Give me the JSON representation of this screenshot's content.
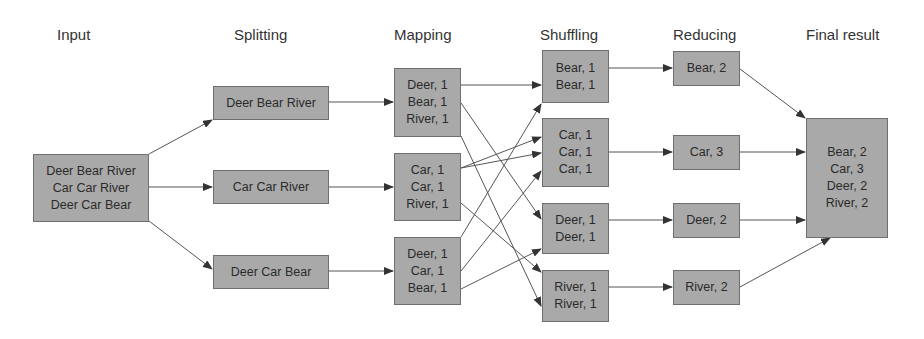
{
  "headers": {
    "input": "Input",
    "splitting": "Splitting",
    "mapping": "Mapping",
    "shuffling": "Shuffling",
    "reducing": "Reducing",
    "final": "Final result"
  },
  "input": {
    "lines": [
      "Deer Bear River",
      "Car Car River",
      "Deer Car Bear"
    ]
  },
  "splitting": [
    {
      "label": "Deer Bear River"
    },
    {
      "label": "Car Car River"
    },
    {
      "label": "Deer Car Bear"
    }
  ],
  "mapping": [
    {
      "lines": [
        "Deer, 1",
        "Bear, 1",
        "River, 1"
      ]
    },
    {
      "lines": [
        "Car, 1",
        "Car, 1",
        "River, 1"
      ]
    },
    {
      "lines": [
        "Deer, 1",
        "Car, 1",
        "Bear, 1"
      ]
    }
  ],
  "shuffling": [
    {
      "lines": [
        "Bear, 1",
        "Bear, 1"
      ]
    },
    {
      "lines": [
        "Car, 1",
        "Car, 1",
        "Car, 1"
      ]
    },
    {
      "lines": [
        "Deer, 1",
        "Deer, 1"
      ]
    },
    {
      "lines": [
        "River, 1",
        "River, 1"
      ]
    }
  ],
  "reducing": [
    {
      "label": "Bear, 2"
    },
    {
      "label": "Car, 3"
    },
    {
      "label": "Deer, 2"
    },
    {
      "label": "River, 2"
    }
  ],
  "final": {
    "lines": [
      "Bear, 2",
      "Car, 3",
      "Deer, 2",
      "River, 2"
    ]
  },
  "colors": {
    "box_fill": "#a9a9a9",
    "box_border": "#6f6f6f",
    "line": "#444444"
  }
}
